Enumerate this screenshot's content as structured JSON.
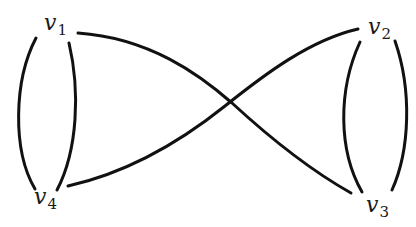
{
  "diagram": {
    "type": "multigraph",
    "vertices": [
      {
        "id": "v1",
        "name": "v",
        "subscript": "1"
      },
      {
        "id": "v2",
        "name": "v",
        "subscript": "2"
      },
      {
        "id": "v3",
        "name": "v",
        "subscript": "3"
      },
      {
        "id": "v4",
        "name": "v",
        "subscript": "4"
      }
    ],
    "edges": [
      {
        "from": "v1",
        "to": "v4",
        "note": "outer arc"
      },
      {
        "from": "v1",
        "to": "v4",
        "note": "inner arc"
      },
      {
        "from": "v2",
        "to": "v3",
        "note": "inner arc"
      },
      {
        "from": "v2",
        "to": "v3",
        "note": "outer arc"
      },
      {
        "from": "v1",
        "to": "v3",
        "note": "crossing curve"
      },
      {
        "from": "v4",
        "to": "v2",
        "note": "crossing curve"
      }
    ],
    "colors": {
      "stroke": "#111111",
      "background": "#ffffff"
    }
  }
}
